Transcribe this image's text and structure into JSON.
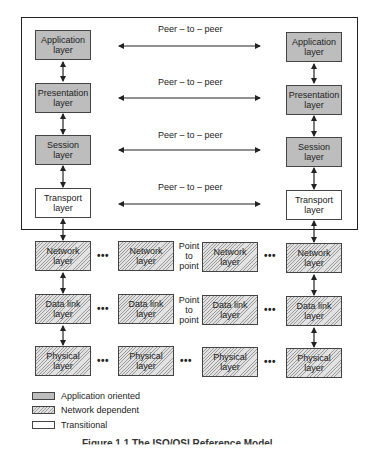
{
  "diagram": {
    "peer_label": "Peer – to – peer",
    "point_label": [
      "Point",
      "to",
      "point"
    ],
    "dots": "•••",
    "columns": {
      "left": [
        "Application layer",
        "Presentation layer",
        "Session layer",
        "Transport layer",
        "Network layer",
        "Data link layer",
        "Physical layer"
      ],
      "right": [
        "Application layer",
        "Presentation layer",
        "Session layer",
        "Transport layer",
        "Network layer",
        "Data link layer",
        "Physical layer"
      ],
      "mid1": [
        "Network layer",
        "Data link layer",
        "Physical layer"
      ],
      "mid2": [
        "Network layer",
        "Data link layer",
        "Physical layer"
      ]
    },
    "labels": {
      "application": [
        "Application",
        "layer"
      ],
      "presentation": [
        "Presentation",
        "layer"
      ],
      "session": [
        "Session",
        "layer"
      ],
      "transport": [
        "Transport",
        "layer"
      ],
      "network": [
        "Network",
        "layer"
      ],
      "datalink": [
        "Data link",
        "layer"
      ],
      "physical": [
        "Physical",
        "layer"
      ]
    },
    "legend": [
      {
        "label": "Application oriented",
        "style": "gray"
      },
      {
        "label": "Network dependent",
        "style": "hatched"
      },
      {
        "label": "Transitional",
        "style": "white"
      }
    ],
    "caption": "Figure 1.1  The ISO/OSI Reference Model"
  },
  "colors": {
    "app_fill": "#bdbdbd",
    "border": "#222222"
  }
}
